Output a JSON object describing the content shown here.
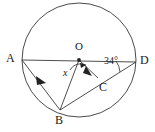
{
  "figure": {
    "type": "circle-geometry-diagram",
    "background_color": "#ffffff",
    "stroke_color": "#3a3a3a",
    "label_color": "#1a1a1a"
  },
  "circle": {
    "center_label": "O",
    "center_x": 79,
    "center_y": 60,
    "radius": 57
  },
  "points": {
    "A": {
      "label": "A",
      "x": 22,
      "y": 60
    },
    "B": {
      "label": "B",
      "x": 60,
      "y": 110
    },
    "C": {
      "label": "C",
      "x": 98,
      "y": 78
    },
    "D": {
      "label": "D",
      "x": 136,
      "y": 62
    },
    "O": {
      "label": "O",
      "x": 79,
      "y": 60
    }
  },
  "segments": [
    {
      "name": "AD",
      "from": "A",
      "to": "D",
      "has_arrow": false
    },
    {
      "name": "AB",
      "from": "A",
      "to": "B",
      "has_arrow": true
    },
    {
      "name": "BD",
      "from": "B",
      "to": "D",
      "has_arrow": false
    },
    {
      "name": "OC",
      "from": "O",
      "to": "C",
      "has_arrow": true
    },
    {
      "name": "OB",
      "from": "O",
      "to": "B",
      "has_arrow": false
    }
  ],
  "angles": {
    "at_center": {
      "label": "x",
      "vertex": "O"
    },
    "at_D": {
      "label": "34°",
      "value": 34,
      "unit": "degrees",
      "vertex": "D"
    }
  }
}
